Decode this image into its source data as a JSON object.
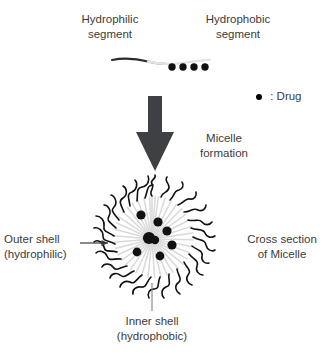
{
  "diagram": {
    "title_implicit": "Micelle formation and cross section of micelle",
    "background_color": "#ffffff",
    "text_color": "#3b3b3b",
    "labels": {
      "hydrophilic_segment": "Hydrophilic\nsegment",
      "hydrophobic_segment": "Hydrophobic\nsegment",
      "micelle_formation": "Micelle\nformation",
      "cross_section": "Cross section\nof Micelle",
      "outer_shell": "Outer shell\n(hydrophilic)",
      "inner_shell": "Inner shell\n(hydrophobic)",
      "drug_legend": ":  Drug"
    },
    "icons": {
      "drug_dot": "filled-circle-icon",
      "down_arrow": "thick-down-arrow-icon",
      "pointer_arrow": "right-arrow-icon",
      "leader_line": "vertical-leader-line-icon"
    },
    "colors": {
      "arrow_fill": "#3f4044",
      "drug_dot_fill": "#000000",
      "outer_chain_stroke": "#111111",
      "inner_chain_stroke": "#d9d9d9",
      "hydrophilic_chain_stroke": "#2b2b2b",
      "hydrophobic_chain_stroke": "#e2e2e2",
      "leader_stroke": "#8d8d8d"
    },
    "polymer_chain": {
      "hydrophilic_side": "left",
      "hydrophobic_side": "right",
      "drug_dot_count": 4
    },
    "micelle": {
      "center_x": 152,
      "center_y": 239,
      "radius": 52,
      "drug_dot_count": 8,
      "radial_chain_count": 40,
      "shell_structure": [
        "outer shell (hydrophilic)",
        "inner shell (hydrophobic)"
      ]
    }
  }
}
